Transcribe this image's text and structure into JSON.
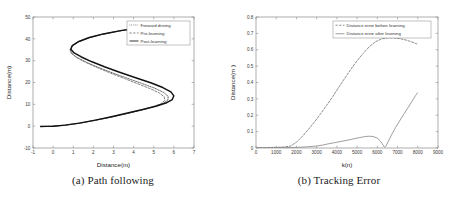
{
  "figure": {
    "background": "#ffffff",
    "panels": [
      {
        "id": "panel-a",
        "caption": "(a) Path following"
      },
      {
        "id": "panel-b",
        "caption": "(b) Tracking Error"
      }
    ]
  },
  "chart_data": [
    {
      "type": "line",
      "id": "path-following",
      "title": "",
      "xlabel": "Distance(m)",
      "ylabel": "Distance(m)",
      "xlim": [
        -1,
        7
      ],
      "ylim": [
        -10,
        50
      ],
      "xticks": [
        -1,
        0,
        1,
        2,
        3,
        4,
        5,
        6,
        7
      ],
      "yticks": [
        -10,
        0,
        10,
        20,
        30,
        40,
        50
      ],
      "xticklabels": [
        "-1",
        "0",
        "1",
        "2",
        "3",
        "4",
        "5",
        "6",
        "7"
      ],
      "yticklabels": [
        "-10",
        "0",
        "10",
        "20",
        "30",
        "40",
        "50"
      ],
      "grid": false,
      "legend_position": "upper-right",
      "legend": [
        {
          "label": "Forward driving",
          "style": "dotted",
          "color": "#4d4d4d"
        },
        {
          "label": "Pre-learning",
          "style": "dashed",
          "color": "#6e6e6e"
        },
        {
          "label": "Post-learning",
          "style": "solid",
          "color": "#111111"
        }
      ],
      "series": [
        {
          "name": "Forward driving",
          "style": "dotted",
          "color": "#4d4d4d",
          "points": [
            [
              -0.62,
              -0.12
            ],
            [
              -0.3,
              -0.08
            ],
            [
              0.0,
              0.0
            ],
            [
              0.6,
              0.45
            ],
            [
              1.3,
              1.35
            ],
            [
              2.1,
              2.7
            ],
            [
              2.9,
              4.2
            ],
            [
              3.7,
              5.85
            ],
            [
              4.4,
              7.4
            ],
            [
              5.0,
              8.9
            ],
            [
              5.45,
              10.3
            ],
            [
              5.7,
              11.9
            ],
            [
              5.72,
              13.6
            ],
            [
              5.5,
              15.4
            ],
            [
              5.05,
              17.4
            ],
            [
              4.4,
              19.6
            ],
            [
              3.7,
              21.9
            ],
            [
              2.95,
              24.4
            ],
            [
              2.25,
              26.9
            ],
            [
              1.65,
              29.3
            ],
            [
              1.18,
              31.5
            ],
            [
              0.92,
              33.4
            ],
            [
              0.85,
              35.0
            ],
            [
              0.95,
              36.7
            ],
            [
              1.25,
              38.6
            ],
            [
              1.75,
              40.4
            ],
            [
              2.45,
              42.1
            ],
            [
              3.3,
              43.6
            ],
            [
              4.2,
              44.8
            ],
            [
              5.1,
              45.6
            ],
            [
              5.85,
              46.0
            ]
          ]
        },
        {
          "name": "Pre-learning",
          "style": "dashed",
          "color": "#6e6e6e",
          "points": [
            [
              -0.62,
              -0.12
            ],
            [
              -0.3,
              -0.08
            ],
            [
              0.0,
              0.0
            ],
            [
              0.6,
              0.45
            ],
            [
              1.3,
              1.35
            ],
            [
              2.1,
              2.7
            ],
            [
              2.9,
              4.2
            ],
            [
              3.7,
              5.85
            ],
            [
              4.4,
              7.4
            ],
            [
              4.95,
              8.85
            ],
            [
              5.35,
              10.25
            ],
            [
              5.55,
              11.8
            ],
            [
              5.52,
              13.45
            ],
            [
              5.28,
              15.2
            ],
            [
              4.82,
              17.2
            ],
            [
              4.2,
              19.45
            ],
            [
              3.55,
              21.8
            ],
            [
              2.85,
              24.3
            ],
            [
              2.2,
              26.8
            ],
            [
              1.62,
              29.2
            ],
            [
              1.16,
              31.45
            ],
            [
              0.9,
              33.35
            ],
            [
              0.84,
              35.0
            ],
            [
              0.95,
              36.7
            ],
            [
              1.25,
              38.6
            ],
            [
              1.75,
              40.4
            ],
            [
              2.45,
              42.1
            ],
            [
              3.3,
              43.6
            ],
            [
              4.2,
              44.8
            ],
            [
              5.1,
              45.6
            ],
            [
              5.85,
              46.0
            ]
          ]
        },
        {
          "name": "Post-learning",
          "style": "solid",
          "color": "#111111",
          "points": [
            [
              -0.62,
              -0.14
            ],
            [
              -0.3,
              -0.1
            ],
            [
              0.0,
              0.0
            ],
            [
              0.6,
              0.48
            ],
            [
              1.3,
              1.4
            ],
            [
              2.1,
              2.78
            ],
            [
              2.9,
              4.32
            ],
            [
              3.7,
              6.0
            ],
            [
              4.45,
              7.6
            ],
            [
              5.1,
              9.15
            ],
            [
              5.6,
              10.6
            ],
            [
              5.92,
              12.2
            ],
            [
              6.0,
              13.9
            ],
            [
              5.85,
              15.7
            ],
            [
              5.45,
              17.7
            ],
            [
              4.85,
              19.9
            ],
            [
              4.1,
              22.2
            ],
            [
              3.3,
              24.7
            ],
            [
              2.55,
              27.2
            ],
            [
              1.9,
              29.6
            ],
            [
              1.38,
              31.8
            ],
            [
              1.02,
              33.7
            ],
            [
              0.88,
              35.2
            ],
            [
              0.95,
              36.9
            ],
            [
              1.28,
              38.8
            ],
            [
              1.8,
              40.6
            ],
            [
              2.5,
              42.25
            ],
            [
              3.35,
              43.75
            ],
            [
              4.25,
              44.95
            ],
            [
              5.15,
              45.75
            ],
            [
              5.9,
              46.1
            ]
          ]
        }
      ]
    },
    {
      "type": "line",
      "id": "tracking-error",
      "title": "",
      "xlabel": "k(n)",
      "ylabel": "Distance(m )",
      "xlim": [
        0,
        9000
      ],
      "ylim": [
        0,
        0.8
      ],
      "xticks": [
        0,
        1000,
        2000,
        3000,
        4000,
        5000,
        6000,
        7000,
        8000,
        9000
      ],
      "yticks": [
        0,
        0.1,
        0.2,
        0.3,
        0.4,
        0.5,
        0.6,
        0.7,
        0.8
      ],
      "xticklabels": [
        "0",
        "1000",
        "2000",
        "3000",
        "4000",
        "5000",
        "6000",
        "7000",
        "8000",
        "9000"
      ],
      "yticklabels": [
        "0",
        "0.1",
        "0.2",
        "0.3",
        "0.4",
        "0.5",
        "0.6",
        "0.7",
        "0.8"
      ],
      "grid": false,
      "legend_position": "upper-right",
      "legend": [
        {
          "label": "Distance error before learning",
          "style": "dashed",
          "color": "#7a7a7a"
        },
        {
          "label": "Distance error after learning",
          "style": "solid",
          "color": "#8c8c8c"
        }
      ],
      "series": [
        {
          "name": "Distance error before learning",
          "style": "dashed",
          "color": "#7a7a7a",
          "points": [
            [
              0,
              0.002
            ],
            [
              500,
              0.003
            ],
            [
              1000,
              0.004
            ],
            [
              1400,
              0.006
            ],
            [
              1700,
              0.012
            ],
            [
              2000,
              0.035
            ],
            [
              2300,
              0.072
            ],
            [
              2600,
              0.115
            ],
            [
              2900,
              0.16
            ],
            [
              3200,
              0.21
            ],
            [
              3500,
              0.262
            ],
            [
              3800,
              0.315
            ],
            [
              4100,
              0.372
            ],
            [
              4400,
              0.428
            ],
            [
              4700,
              0.482
            ],
            [
              5000,
              0.533
            ],
            [
              5300,
              0.578
            ],
            [
              5600,
              0.618
            ],
            [
              5900,
              0.648
            ],
            [
              6200,
              0.666
            ],
            [
              6500,
              0.672
            ],
            [
              6800,
              0.672
            ],
            [
              7100,
              0.668
            ],
            [
              7400,
              0.66
            ],
            [
              7700,
              0.648
            ],
            [
              7950,
              0.636
            ]
          ]
        },
        {
          "name": "Distance error after learning",
          "style": "solid",
          "color": "#8c8c8c",
          "points": [
            [
              0,
              0.001
            ],
            [
              800,
              0.002
            ],
            [
              1500,
              0.003
            ],
            [
              2000,
              0.004
            ],
            [
              2500,
              0.007
            ],
            [
              3000,
              0.012
            ],
            [
              3300,
              0.018
            ],
            [
              3600,
              0.026
            ],
            [
              3900,
              0.033
            ],
            [
              4200,
              0.04
            ],
            [
              4500,
              0.047
            ],
            [
              4800,
              0.055
            ],
            [
              5100,
              0.063
            ],
            [
              5400,
              0.07
            ],
            [
              5600,
              0.072
            ],
            [
              5800,
              0.07
            ],
            [
              6000,
              0.06
            ],
            [
              6150,
              0.042
            ],
            [
              6280,
              0.018
            ],
            [
              6350,
              0.004
            ],
            [
              6420,
              0.01
            ],
            [
              6550,
              0.042
            ],
            [
              6700,
              0.08
            ],
            [
              6900,
              0.125
            ],
            [
              7100,
              0.165
            ],
            [
              7300,
              0.205
            ],
            [
              7500,
              0.243
            ],
            [
              7700,
              0.283
            ],
            [
              7900,
              0.322
            ],
            [
              7980,
              0.336
            ]
          ]
        }
      ]
    }
  ]
}
